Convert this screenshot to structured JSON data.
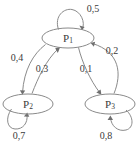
{
  "diagram": {
    "type": "markov-chain-state-diagram",
    "background_color": "#ffffff",
    "stroke_color": "#8a8a8a",
    "text_color": "#3a3a3a",
    "nodes": [
      {
        "id": "P1",
        "label_base": "P",
        "label_sub": "1",
        "cx": 68,
        "cy": 38,
        "rx": 26,
        "ry": 10
      },
      {
        "id": "P2",
        "label_base": "P",
        "label_sub": "2",
        "cx": 28,
        "cy": 104,
        "rx": 25,
        "ry": 10
      },
      {
        "id": "P3",
        "label_base": "P",
        "label_sub": "3",
        "cx": 110,
        "cy": 104,
        "rx": 25,
        "ry": 10
      }
    ],
    "edges": [
      {
        "id": "P1-P1",
        "from": "P1",
        "to": "P1",
        "label": "0,5",
        "label_x": 93,
        "label_y": 10,
        "kind": "self-loop-top"
      },
      {
        "id": "P1-P2",
        "from": "P1",
        "to": "P2",
        "label": "0,4",
        "label_x": 17,
        "label_y": 59,
        "kind": "curve"
      },
      {
        "id": "P2-P1",
        "from": "P2",
        "to": "P1",
        "label": "0,3",
        "label_x": 42,
        "label_y": 70,
        "kind": "curve"
      },
      {
        "id": "P1-P3",
        "from": "P1",
        "to": "P3",
        "label": "0,1",
        "label_x": 86,
        "label_y": 70,
        "kind": "curve"
      },
      {
        "id": "P3-P1",
        "from": "P3",
        "to": "P1",
        "label": "0,2",
        "label_x": 112,
        "label_y": 52,
        "kind": "curve"
      },
      {
        "id": "P2-P2",
        "from": "P2",
        "to": "P2",
        "label": "0,7",
        "label_x": 19,
        "label_y": 137,
        "kind": "self-loop-bottom"
      },
      {
        "id": "P3-P3",
        "from": "P3",
        "to": "P3",
        "label": "0,8",
        "label_x": 106,
        "label_y": 137,
        "kind": "self-loop-bottom-right"
      }
    ]
  }
}
